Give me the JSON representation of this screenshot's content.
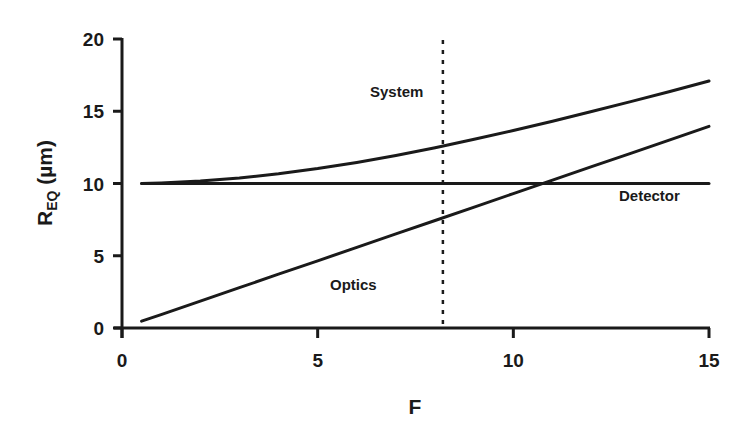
{
  "chart_data": {
    "type": "line",
    "title": "",
    "xlabel": "F",
    "ylabel": "R_EQ (µm)",
    "ylabel_main": "R",
    "ylabel_sub": "EQ",
    "ylabel_unit": " (µm)",
    "xlim": [
      0,
      15
    ],
    "ylim": [
      0,
      20
    ],
    "xticks": [
      0,
      5,
      10,
      15
    ],
    "yticks": [
      0,
      5,
      10,
      15,
      20
    ],
    "grid": false,
    "legend": "inline labels",
    "x": [
      0.5,
      1,
      2,
      3,
      4,
      5,
      6,
      7,
      8,
      9,
      10,
      11,
      12,
      13,
      14,
      15
    ],
    "series": [
      {
        "name": "System",
        "values": [
          10.0,
          10.04,
          10.17,
          10.38,
          10.67,
          11.03,
          11.46,
          11.94,
          12.48,
          13.06,
          13.67,
          14.31,
          14.98,
          15.67,
          16.37,
          17.09
        ]
      },
      {
        "name": "Detector",
        "values": [
          10,
          10,
          10,
          10,
          10,
          10,
          10,
          10,
          10,
          10,
          10,
          10,
          10,
          10,
          10,
          10
        ]
      },
      {
        "name": "Optics",
        "values": [
          0.47,
          0.93,
          1.86,
          2.79,
          3.72,
          4.65,
          5.58,
          6.51,
          7.44,
          8.37,
          9.3,
          10.23,
          11.16,
          12.09,
          13.02,
          13.95
        ]
      }
    ],
    "annotations": [
      {
        "type": "vertical-dashed-line",
        "x": 8.2
      },
      {
        "text": "System",
        "x": 8.7,
        "y": 16.7
      },
      {
        "text": "Detector",
        "x": 12.3,
        "y": 8.8
      },
      {
        "text": "Optics",
        "x": 5.3,
        "y": 2.9
      }
    ]
  },
  "labels": {
    "x_ticks": [
      "0",
      "5",
      "10",
      "15"
    ],
    "y_ticks": [
      "0",
      "5",
      "10",
      "15",
      "20"
    ],
    "x_title": "F",
    "y_title_main": "R",
    "y_title_sub": "EQ",
    "y_title_unit": " (µm)",
    "system": "System",
    "detector": "Detector",
    "optics": "Optics"
  }
}
